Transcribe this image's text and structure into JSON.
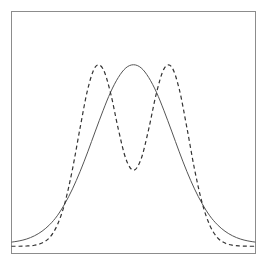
{
  "chart_data": {
    "type": "line",
    "title": "",
    "xlabel": "",
    "ylabel": "",
    "xlim": [
      -4,
      4
    ],
    "ylim": [
      0,
      1
    ],
    "grid": false,
    "legend": null,
    "axes": {
      "ticks": false,
      "frame": true,
      "frame_color": "#8c8c8c"
    },
    "x": [
      -4.0,
      -3.75,
      -3.5,
      -3.25,
      -3.0,
      -2.75,
      -2.5,
      -2.25,
      -2.0,
      -1.75,
      -1.5,
      -1.25,
      -1.0,
      -0.75,
      -0.5,
      -0.25,
      0.0,
      0.25,
      0.5,
      0.75,
      1.0,
      1.25,
      1.5,
      1.75,
      2.0,
      2.25,
      2.5,
      2.75,
      3.0,
      3.25,
      3.5,
      3.75,
      4.0
    ],
    "series": [
      {
        "name": "unimodal (solid)",
        "style": "solid",
        "color": "#555555",
        "values": [
          0.047,
          0.052,
          0.06,
          0.073,
          0.092,
          0.119,
          0.156,
          0.206,
          0.267,
          0.339,
          0.42,
          0.506,
          0.59,
          0.667,
          0.727,
          0.767,
          0.78,
          0.767,
          0.727,
          0.667,
          0.59,
          0.506,
          0.42,
          0.339,
          0.267,
          0.206,
          0.156,
          0.119,
          0.092,
          0.073,
          0.06,
          0.052,
          0.047
        ]
      },
      {
        "name": "bimodal (dashed)",
        "style": "dashed",
        "color": "#333333",
        "values": [
          0.03,
          0.03,
          0.031,
          0.034,
          0.043,
          0.066,
          0.117,
          0.209,
          0.349,
          0.52,
          0.679,
          0.771,
          0.763,
          0.662,
          0.515,
          0.391,
          0.344,
          0.391,
          0.515,
          0.662,
          0.763,
          0.771,
          0.679,
          0.52,
          0.349,
          0.209,
          0.117,
          0.066,
          0.043,
          0.034,
          0.031,
          0.03,
          0.03
        ]
      }
    ]
  }
}
